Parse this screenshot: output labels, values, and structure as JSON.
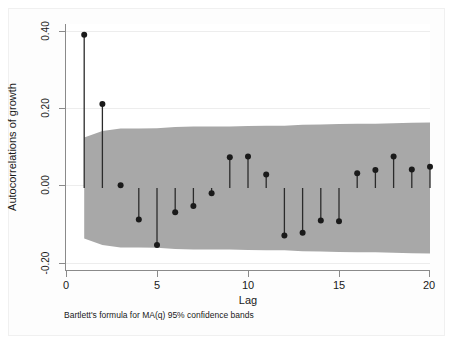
{
  "chart_data": {
    "type": "line",
    "subtype": "correlogram-stem",
    "title": "",
    "xlabel": "Lag",
    "ylabel": "Autocorrelations of growth",
    "note": "Bartlett's formula for MA(q) 95% confidence bands",
    "x": [
      1,
      2,
      3,
      4,
      5,
      6,
      7,
      8,
      9,
      10,
      11,
      12,
      13,
      14,
      15,
      16,
      17,
      18,
      19,
      20
    ],
    "values": [
      0.374,
      0.205,
      0.007,
      -0.077,
      -0.139,
      -0.059,
      -0.044,
      -0.013,
      0.075,
      0.077,
      0.033,
      -0.116,
      -0.109,
      -0.079,
      -0.081,
      0.036,
      0.044,
      0.077,
      0.045,
      0.052
    ],
    "series": [
      {
        "name": "Autocorrelation",
        "values": [
          0.374,
          0.205,
          0.007,
          -0.077,
          -0.139,
          -0.059,
          -0.044,
          -0.013,
          0.075,
          0.077,
          0.033,
          -0.116,
          -0.109,
          -0.079,
          -0.081,
          0.036,
          0.044,
          0.077,
          0.045,
          0.052
        ]
      }
    ],
    "confidence_band": {
      "label": "Bartlett's formula for MA(q) 95% confidence bands",
      "level": "95%",
      "upper": [
        0.123,
        0.139,
        0.145,
        0.145,
        0.146,
        0.149,
        0.15,
        0.15,
        0.15,
        0.151,
        0.152,
        0.152,
        0.154,
        0.155,
        0.156,
        0.157,
        0.157,
        0.158,
        0.159,
        0.16
      ],
      "lower": [
        -0.123,
        -0.139,
        -0.145,
        -0.145,
        -0.146,
        -0.149,
        -0.15,
        -0.15,
        -0.15,
        -0.151,
        -0.152,
        -0.152,
        -0.154,
        -0.155,
        -0.156,
        -0.157,
        -0.157,
        -0.158,
        -0.159,
        -0.16
      ],
      "color": "#a8a8a8"
    },
    "xlim": [
      0,
      20
    ],
    "ylim": [
      -0.2,
      0.4
    ],
    "x_ticks": [
      0,
      5,
      10,
      15,
      20
    ],
    "x_tick_labels": [
      "0",
      "5",
      "10",
      "15",
      "20"
    ],
    "y_ticks": [
      -0.2,
      0.0,
      0.2,
      0.4
    ],
    "y_tick_labels": [
      "-0.20",
      "0.00",
      "0.20",
      "0.40"
    ],
    "grid": true,
    "legend": "none",
    "marker_color": "#1a1a1a",
    "stem_color": "#2b2b2b",
    "background": "#ffffff"
  }
}
